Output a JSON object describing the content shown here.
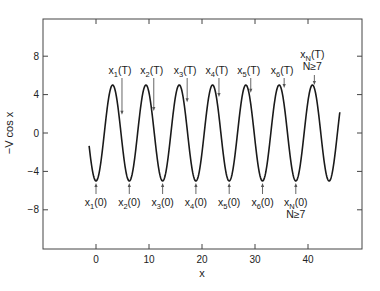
{
  "chart_data": {
    "type": "line",
    "title": "",
    "xlabel": "x",
    "ylabel": "−V cos x",
    "xlim": [
      -10,
      50.5
    ],
    "ylim": [
      -12,
      12
    ],
    "xticks": [
      0,
      10,
      20,
      30,
      40
    ],
    "xtick_labels": [
      "0",
      "10",
      "20",
      "30",
      "40"
    ],
    "yticks": [
      8,
      4,
      0,
      -4,
      -8
    ],
    "ytick_labels": [
      "8",
      "4",
      "0",
      "−4",
      "−8"
    ],
    "grid": false,
    "legend": null,
    "series": [
      {
        "name": "-V cos x",
        "function": "-5*cos(x)",
        "amplitude_V": 5,
        "x_range": [
          -1.3,
          46.0
        ],
        "color": "#1a1a1a"
      }
    ],
    "annotations_T": [
      {
        "label_main": "x",
        "label_sub": "1",
        "label_tail": "(T)",
        "x": 4.9,
        "y": 1.9
      },
      {
        "label_main": "x",
        "label_sub": "2",
        "label_tail": "(T)",
        "x": 10.9,
        "y": 2.3
      },
      {
        "label_main": "x",
        "label_sub": "3",
        "label_tail": "(T)",
        "x": 17.2,
        "y": 3.2
      },
      {
        "label_main": "x",
        "label_sub": "4",
        "label_tail": "(T)",
        "x": 23.2,
        "y": 3.75
      },
      {
        "label_main": "x",
        "label_sub": "5",
        "label_tail": "(T)",
        "x": 29.2,
        "y": 4.2
      },
      {
        "label_main": "x",
        "label_sub": "6",
        "label_tail": "(T)",
        "x": 35.5,
        "y": 4.7
      },
      {
        "label_main": "x",
        "label_sub": "N",
        "label_tail": "(T)",
        "label_line2": "N≥7",
        "x": 41.2,
        "y": 5.0
      }
    ],
    "annotations_0": [
      {
        "label_main": "x",
        "label_sub": "1",
        "label_tail": "(0)",
        "x": 0.0,
        "y": -5
      },
      {
        "label_main": "x",
        "label_sub": "2",
        "label_tail": "(0)",
        "x": 6.28,
        "y": -5
      },
      {
        "label_main": "x",
        "label_sub": "3",
        "label_tail": "(0)",
        "x": 12.57,
        "y": -5
      },
      {
        "label_main": "x",
        "label_sub": "4",
        "label_tail": "(0)",
        "x": 18.85,
        "y": -5
      },
      {
        "label_main": "x",
        "label_sub": "5",
        "label_tail": "(0)",
        "x": 25.13,
        "y": -5
      },
      {
        "label_main": "x",
        "label_sub": "6",
        "label_tail": "(0)",
        "x": 31.42,
        "y": -5
      },
      {
        "label_main": "x",
        "label_sub": "N",
        "label_tail": "(0)",
        "label_line2": "N≥7",
        "x": 37.7,
        "y": -5
      }
    ]
  },
  "colors": {
    "curve": "#1a1a1a",
    "axis": "#444444",
    "arrow": "#555555",
    "background": "#ffffff"
  }
}
